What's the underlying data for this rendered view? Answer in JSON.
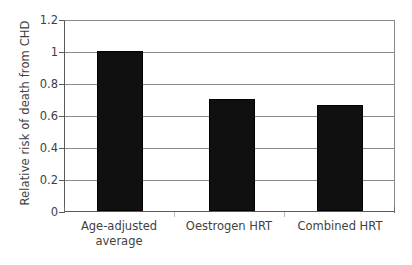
{
  "chart_data": {
    "type": "bar",
    "title": "",
    "xlabel": "",
    "ylabel": "Relative risk of death from CHD",
    "categories": [
      "Age-adjusted average",
      "Oestrogen HRT",
      "Combined HRT"
    ],
    "category_lines": [
      [
        "Age-adjusted",
        "average"
      ],
      [
        "Oestrogen HRT",
        ""
      ],
      [
        "Combined HRT",
        ""
      ]
    ],
    "values": [
      1.0,
      0.7,
      0.66
    ],
    "ylim": [
      0,
      1.2
    ],
    "ytick_labels": [
      "0",
      "0.2",
      "0.4",
      "0.6",
      "0.8",
      "1",
      "1.2"
    ],
    "ytick_values": [
      0,
      0.2,
      0.4,
      0.6,
      0.8,
      1.0,
      1.2
    ],
    "grid": true,
    "legend": "none",
    "bar_color": "#101010",
    "grid_color": "#8a8a8a",
    "axis_color": "#5a5a5a",
    "background_color": "#ffffff"
  },
  "axis": {
    "y_title": "Relative risk of death from CHD"
  },
  "ticks": {
    "t0": "0",
    "t1": "0.2",
    "t2": "0.4",
    "t3": "0.6",
    "t4": "0.8",
    "t5": "1",
    "t6": "1.2"
  },
  "categories": {
    "c0_line1": "Age-adjusted",
    "c0_line2": "average",
    "c1_line1": "Oestrogen HRT",
    "c1_line2": "",
    "c2_line1": "Combined HRT",
    "c2_line2": ""
  }
}
